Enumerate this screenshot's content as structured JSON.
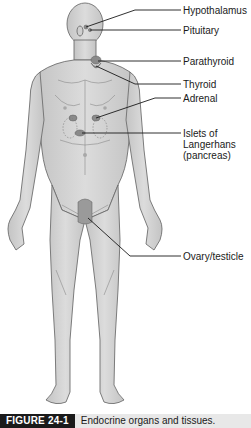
{
  "figure": {
    "labels": [
      {
        "id": "hypothalamus",
        "text": "Hypothalamus"
      },
      {
        "id": "pituitary",
        "text": "Pituitary"
      },
      {
        "id": "parathyroid",
        "text": "Parathyroid"
      },
      {
        "id": "thyroid",
        "text": "Thyroid"
      },
      {
        "id": "adrenal",
        "text": "Adrenal"
      },
      {
        "id": "islets",
        "text": "Islets of Langerhans (pancreas)"
      },
      {
        "id": "ovary_testicle",
        "text": "Ovary/testicle"
      }
    ],
    "caption": {
      "tag": "FIGURE 24-1",
      "text": "Endocrine organs and tissues."
    }
  },
  "colors": {
    "skin": "#d4d4d4",
    "outline": "#6e6e6e",
    "gland": "#8a8a8a",
    "leader_line": "#1a1a1a",
    "caption_bg": "#e8e8e8",
    "caption_tag_bg": "#1a1a1a"
  }
}
